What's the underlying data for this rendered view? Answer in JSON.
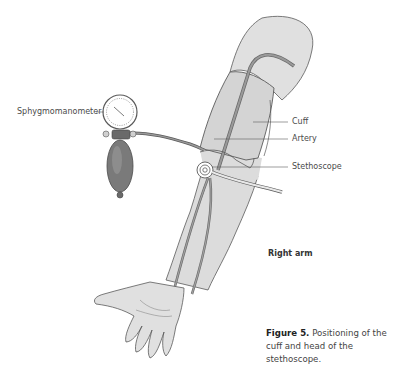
{
  "figure": {
    "labels": {
      "sphygmomanometer": "Sphygmomanometer",
      "cuff": "Cuff",
      "artery": "Artery",
      "stethoscope": "Stethoscope",
      "arm_side": "Right arm"
    },
    "caption": {
      "number": "Figure 5.",
      "text": "Positioning of the cuff and head of the stethoscope."
    },
    "colors": {
      "skin": "#dcdcdc",
      "cuff": "#d4d4d4",
      "outline": "#5a5a5a",
      "artery": "#8a8a8a",
      "bulb": "#7a7a7a",
      "label_text": "#4a4a4a"
    }
  }
}
